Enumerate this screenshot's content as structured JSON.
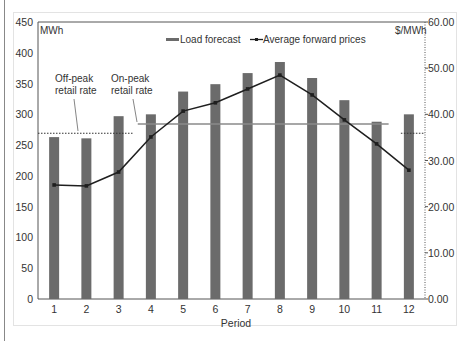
{
  "chart_data": {
    "type": "bar+line",
    "title": "",
    "xlabel": "Period",
    "ylabel_left": "MWh",
    "ylabel_right": "$/MWh",
    "categories": [
      "1",
      "2",
      "3",
      "4",
      "5",
      "6",
      "7",
      "8",
      "9",
      "10",
      "11",
      "12"
    ],
    "series": [
      {
        "name": "Load forecast",
        "type": "bar",
        "axis": "left",
        "values": [
          263,
          261,
          297,
          300,
          337,
          349,
          367,
          385,
          359,
          323,
          288,
          300
        ]
      },
      {
        "name": "Average forward prices",
        "type": "line",
        "axis": "right",
        "values": [
          24.7,
          24.5,
          27.5,
          35.1,
          40.7,
          42.5,
          45.5,
          48.5,
          44.2,
          38.8,
          33.6,
          27.9
        ]
      }
    ],
    "reference_lines": [
      {
        "name": "Off-peak retail rate",
        "style": "dotted",
        "value_right": 35.9,
        "periods": [
          "1-3",
          "12"
        ]
      },
      {
        "name": "On-peak retail rate",
        "style": "solid",
        "value_right": 37.9,
        "periods": [
          "4-11"
        ]
      }
    ],
    "ylim_left": [
      0,
      450
    ],
    "yticks_left": [
      "0",
      "50",
      "100",
      "150",
      "200",
      "250",
      "300",
      "350",
      "400",
      "450"
    ],
    "ylim_right": [
      0,
      60
    ],
    "yticks_right": [
      "0.00",
      "10.00",
      "20.00",
      "30.00",
      "40.00",
      "50.00",
      "60.00"
    ],
    "legend": {
      "position": "top-right",
      "entries": [
        "Load forecast",
        "Average forward prices"
      ]
    },
    "grid": false
  },
  "labels": {
    "left_unit": "MWh",
    "right_unit": "$/MWh",
    "xlabel": "Period",
    "legend_bar": "Load forecast",
    "legend_line": "Average forward prices",
    "offpeak_line1": "Off-peak",
    "offpeak_line2": "retail rate",
    "onpeak_line1": "On-peak",
    "onpeak_line2": "retail rate"
  },
  "colors": {
    "bar": "#6b6b6b",
    "line": "#1f1f1f",
    "onpeak": "#8a8a8a",
    "axis": "#555555"
  }
}
